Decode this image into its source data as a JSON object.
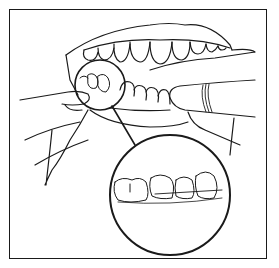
{
  "illustration": {
    "subject": "Flossing teeth with magnified inset",
    "colors": {
      "line": "#1a1a1a",
      "background": "#ffffff"
    }
  }
}
